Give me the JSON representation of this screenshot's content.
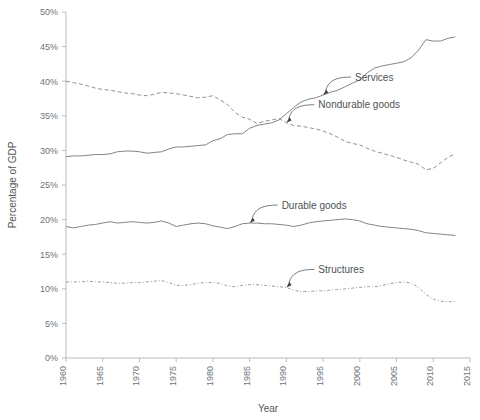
{
  "chart_data": {
    "type": "line",
    "title": "",
    "xlabel": "Year",
    "ylabel": "Percentage of GDP",
    "xlim": [
      1960,
      2015
    ],
    "ylim": [
      0,
      50
    ],
    "grid": false,
    "legend_position": "inline-annotations",
    "x_tick_labels": [
      "1960",
      "1965",
      "1970",
      "1975",
      "1980",
      "1985",
      "1990",
      "1995",
      "2000",
      "2005",
      "2010",
      "2015"
    ],
    "y_tick_labels": [
      "0%",
      "5%",
      "10%",
      "15%",
      "20%",
      "25%",
      "30%",
      "35%",
      "40%",
      "45%",
      "50%"
    ],
    "x": [
      1960,
      1961,
      1962,
      1963,
      1964,
      1965,
      1966,
      1967,
      1968,
      1969,
      1970,
      1971,
      1972,
      1973,
      1974,
      1975,
      1976,
      1977,
      1978,
      1979,
      1980,
      1981,
      1982,
      1983,
      1984,
      1985,
      1986,
      1987,
      1988,
      1989,
      1990,
      1991,
      1992,
      1993,
      1994,
      1995,
      1996,
      1997,
      1998,
      1999,
      2000,
      2001,
      2002,
      2003,
      2004,
      2005,
      2006,
      2007,
      2008,
      2009,
      2010,
      2011,
      2012,
      2013
    ],
    "series": [
      {
        "name": "Services",
        "style": "solid",
        "color": "#808588",
        "values": [
          29.1,
          29.2,
          29.2,
          29.3,
          29.4,
          29.4,
          29.5,
          29.8,
          29.9,
          29.9,
          29.8,
          29.6,
          29.7,
          29.8,
          30.2,
          30.5,
          30.5,
          30.6,
          30.7,
          30.8,
          31.4,
          31.7,
          32.3,
          32.4,
          32.4,
          33.2,
          33.6,
          33.8,
          34.0,
          34.4,
          35.3,
          36.2,
          37.0,
          37.4,
          37.6,
          38.0,
          38.4,
          38.7,
          39.2,
          39.7,
          40.2,
          41.2,
          41.9,
          42.2,
          42.4,
          42.6,
          42.8,
          43.4,
          44.5,
          46.0,
          45.8,
          45.8,
          46.2,
          46.4
        ]
      },
      {
        "name": "Nondurable goods",
        "style": "dashed",
        "color": "#8d9295",
        "values": [
          40.0,
          39.8,
          39.6,
          39.3,
          39.0,
          38.8,
          38.7,
          38.5,
          38.3,
          38.2,
          38.0,
          37.9,
          38.1,
          38.4,
          38.3,
          38.2,
          38.0,
          37.8,
          37.6,
          37.7,
          37.9,
          37.3,
          36.6,
          35.5,
          34.8,
          34.5,
          33.9,
          34.2,
          34.4,
          34.6,
          34.0,
          33.6,
          33.5,
          33.3,
          33.1,
          32.8,
          32.4,
          31.9,
          31.3,
          31.0,
          30.8,
          30.3,
          29.9,
          29.6,
          29.3,
          29.0,
          28.6,
          28.3,
          28.0,
          27.2,
          27.4,
          28.2,
          29.0,
          29.5
        ]
      },
      {
        "name": "Durable goods",
        "style": "solid",
        "color": "#808588",
        "values": [
          19.0,
          18.8,
          19.0,
          19.2,
          19.3,
          19.5,
          19.7,
          19.5,
          19.6,
          19.7,
          19.6,
          19.5,
          19.6,
          19.8,
          19.5,
          19.0,
          19.2,
          19.4,
          19.5,
          19.4,
          19.1,
          18.9,
          18.7,
          19.0,
          19.4,
          19.5,
          19.5,
          19.4,
          19.4,
          19.3,
          19.2,
          19.0,
          19.2,
          19.5,
          19.7,
          19.8,
          19.9,
          20.0,
          20.1,
          20.0,
          19.8,
          19.4,
          19.2,
          19.0,
          18.9,
          18.8,
          18.7,
          18.6,
          18.4,
          18.1,
          18.0,
          17.9,
          17.8,
          17.7
        ]
      },
      {
        "name": "Structures",
        "style": "dash-dot",
        "color": "#9aa0a3",
        "values": [
          11.0,
          11.0,
          11.0,
          11.1,
          11.0,
          11.0,
          10.9,
          10.8,
          10.8,
          10.9,
          10.9,
          11.0,
          11.1,
          11.2,
          10.9,
          10.5,
          10.5,
          10.6,
          10.8,
          10.9,
          10.9,
          10.8,
          10.4,
          10.3,
          10.5,
          10.6,
          10.6,
          10.5,
          10.4,
          10.3,
          10.2,
          9.8,
          9.6,
          9.6,
          9.7,
          9.7,
          9.8,
          9.9,
          10.0,
          10.1,
          10.2,
          10.3,
          10.3,
          10.5,
          10.7,
          10.9,
          11.0,
          10.8,
          10.2,
          9.2,
          8.5,
          8.2,
          8.1,
          8.2
        ]
      }
    ],
    "annotations": [
      {
        "label": "Services",
        "points_to_year": 1995,
        "points_to_value": 38.0
      },
      {
        "label": "Nondurable goods",
        "points_to_year": 1990,
        "points_to_value": 34.0
      },
      {
        "label": "Durable goods",
        "points_to_year": 1985,
        "points_to_value": 19.5
      },
      {
        "label": "Structures",
        "points_to_year": 1990,
        "points_to_value": 10.2
      }
    ]
  }
}
